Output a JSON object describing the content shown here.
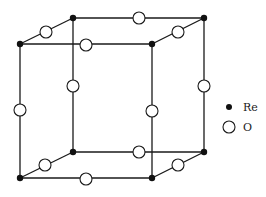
{
  "diagram": {
    "legend": [
      {
        "symbol": "filled-circle",
        "label": "Re"
      },
      {
        "symbol": "open-circle",
        "label": "O"
      }
    ],
    "structure": {
      "corner_atom": "Re",
      "edge_midpoint_atom": "O",
      "corner_count": 8,
      "edge_atom_count": 12
    }
  }
}
